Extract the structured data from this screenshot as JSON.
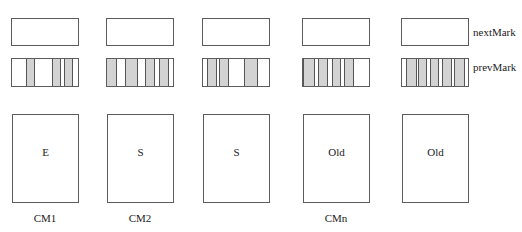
{
  "row_labels": {
    "next_mark": "nextMark",
    "prev_mark": "prevMark"
  },
  "colors": {
    "border": "#5c5c5c",
    "marked_stripe": "#d3d3d3"
  },
  "columns": [
    {
      "region_label": "E",
      "cm_label": "CM1",
      "prev_mark_stripes": [
        [
          15,
          8
        ],
        [
          41,
          8
        ],
        [
          53,
          8
        ]
      ]
    },
    {
      "region_label": "S",
      "cm_label": "CM2",
      "prev_mark_stripes": [
        [
          0,
          10
        ],
        [
          19,
          12
        ],
        [
          39,
          9
        ],
        [
          53,
          9
        ]
      ]
    },
    {
      "region_label": "S",
      "cm_label": "",
      "prev_mark_stripes": [
        [
          5,
          9
        ],
        [
          17,
          9
        ],
        [
          42,
          13
        ]
      ]
    },
    {
      "region_label": "Old",
      "cm_label": "CMn",
      "prev_mark_stripes": [
        [
          1,
          11
        ],
        [
          16,
          9
        ],
        [
          30,
          8
        ],
        [
          42,
          9
        ]
      ]
    },
    {
      "region_label": "Old",
      "cm_label": "",
      "prev_mark_stripes": [
        [
          5,
          10
        ],
        [
          17,
          8
        ],
        [
          29,
          8
        ],
        [
          41,
          9
        ],
        [
          53,
          10
        ]
      ]
    }
  ]
}
